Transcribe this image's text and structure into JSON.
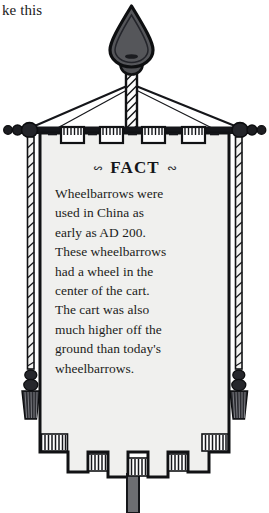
{
  "page": {
    "cut_off_text": "ke this",
    "background_color": "#ffffff"
  },
  "illustration": {
    "name": "fact-banner",
    "description": "Decorative hanging banner with spear finial, crossbar, corded tassels and crenellated fringed hem",
    "colors": {
      "ink": "#1a1a1a",
      "banner_fill": "#f0f0ee",
      "finial_fill": "#55565a",
      "pole_fill": "#6d6e72",
      "hardware_fill": "#2b2c30"
    },
    "parts": {
      "finial": "spear-finial",
      "finial_knob": "finial-knob",
      "mast": "center-mast",
      "crossbar": "crossbar",
      "left_beads": 3,
      "right_beads": 3,
      "stay_lines": 2,
      "hanging_tabs": 4,
      "tab_dashes": 5,
      "side_cords": 2,
      "tassels": 2,
      "bottom_teeth": 5,
      "bottom_pole": "lower-pole"
    }
  },
  "banner": {
    "heading": "FACT",
    "ornament_left": "swash-ornament",
    "ornament_right": "swash-ornament",
    "body_lines": [
      "Wheelbarrows were",
      "used in China as",
      "early as AD 200.",
      "These wheelbarrows",
      "had a wheel in the",
      "center of the cart.",
      "The cart was also",
      "much higher off the",
      "ground than today's",
      "wheelbarrows."
    ],
    "body_text": "Wheelbarrows were used in China as early as AD 200. These wheelbarrows had a wheel in the center of the cart. The cart was also much higher off the ground than today's wheelbarrows."
  }
}
